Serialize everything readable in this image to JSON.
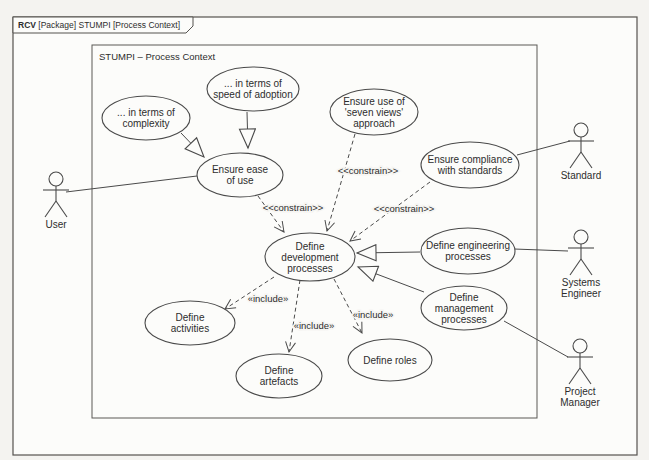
{
  "frame": {
    "keyword": "RCV",
    "title": " [Package] STUMPI [Process Context]"
  },
  "inner": {
    "title": "STUMPI – Process Context"
  },
  "colors": {
    "line": "#4a4a4a",
    "fill": "#fcfcfa",
    "background": "#f4f3f0",
    "text": "#2d2d2d"
  },
  "use_cases": [
    {
      "id": "in-terms-of-complexity",
      "cx": 146,
      "cy": 118,
      "rx": 44,
      "ry": 22,
      "lines": [
        "... in terms of",
        "complexity"
      ]
    },
    {
      "id": "in-terms-of-speed-of-adoption",
      "cx": 253,
      "cy": 89,
      "rx": 46,
      "ry": 22,
      "lines": [
        "... in terms of",
        "speed of adoption"
      ]
    },
    {
      "id": "ensure-ease-of-use",
      "cx": 240,
      "cy": 175,
      "rx": 43,
      "ry": 22,
      "lines": [
        "Ensure ease",
        "of use"
      ]
    },
    {
      "id": "ensure-use-of-seven-views",
      "cx": 374,
      "cy": 112,
      "rx": 44,
      "ry": 23,
      "lines": [
        "Ensure use of",
        "'seven views'",
        "approach"
      ]
    },
    {
      "id": "ensure-compliance-with-standards",
      "cx": 470,
      "cy": 165,
      "rx": 49,
      "ry": 23,
      "lines": [
        "Ensure compliance",
        "with standards"
      ]
    },
    {
      "id": "define-development-processes",
      "cx": 310,
      "cy": 257,
      "rx": 45,
      "ry": 24,
      "lines": [
        "Define",
        "development",
        "processes"
      ]
    },
    {
      "id": "define-engineering-processes",
      "cx": 468,
      "cy": 251,
      "rx": 47,
      "ry": 23,
      "lines": [
        "Define engineering",
        "processes"
      ]
    },
    {
      "id": "define-management-processes",
      "cx": 464,
      "cy": 308,
      "rx": 43,
      "ry": 22,
      "lines": [
        "Define",
        "management",
        "processes"
      ]
    },
    {
      "id": "define-activities",
      "cx": 190,
      "cy": 323,
      "rx": 45,
      "ry": 22,
      "lines": [
        "Define",
        "activities"
      ]
    },
    {
      "id": "define-artefacts",
      "cx": 279,
      "cy": 376,
      "rx": 43,
      "ry": 22,
      "lines": [
        "Define",
        "artefacts"
      ]
    },
    {
      "id": "define-roles",
      "cx": 390,
      "cy": 360,
      "rx": 42,
      "ry": 21,
      "lines": [
        "Define roles"
      ]
    }
  ],
  "actors": [
    {
      "id": "user",
      "cx": 56,
      "head_y": 179,
      "lines": [
        "User"
      ]
    },
    {
      "id": "standard",
      "cx": 581,
      "head_y": 130,
      "lines": [
        "Standard"
      ]
    },
    {
      "id": "systems-engineer",
      "cx": 581,
      "head_y": 237,
      "lines": [
        "Systems",
        "Engineer"
      ]
    },
    {
      "id": "project-manager",
      "cx": 580,
      "head_y": 346,
      "lines": [
        "Project",
        "Manager"
      ]
    }
  ],
  "edges": [
    {
      "id": "user--ensure-ease",
      "kind": "association",
      "dash": false,
      "end": "none",
      "x1": 66,
      "y1": 192,
      "x2": 197,
      "y2": 176
    },
    {
      "id": "compliance--standard",
      "kind": "association",
      "dash": false,
      "end": "none",
      "x1": 517,
      "y1": 155,
      "x2": 570,
      "y2": 141
    },
    {
      "id": "engineering--systems-engineer",
      "kind": "association",
      "dash": false,
      "end": "none",
      "x1": 514,
      "y1": 249,
      "x2": 568,
      "y2": 251
    },
    {
      "id": "management--project-manager",
      "kind": "association",
      "dash": false,
      "end": "none",
      "x1": 504,
      "y1": 321,
      "x2": 568,
      "y2": 357
    },
    {
      "id": "complexity--ensure-ease",
      "kind": "generalization",
      "dash": false,
      "end": "triangle",
      "x1": 181,
      "y1": 133,
      "x2": 204,
      "y2": 157
    },
    {
      "id": "speed--ensure-ease",
      "kind": "generalization",
      "dash": false,
      "end": "triangle",
      "x1": 247,
      "y1": 112,
      "x2": 248,
      "y2": 148
    },
    {
      "id": "engineering--development",
      "kind": "generalization",
      "dash": false,
      "end": "triangle",
      "x1": 420,
      "y1": 252,
      "x2": 357,
      "y2": 253
    },
    {
      "id": "management--development",
      "kind": "generalization",
      "dash": false,
      "end": "triangle",
      "x1": 424,
      "y1": 292,
      "x2": 358,
      "y2": 267
    },
    {
      "id": "ensure-ease--development-constrain",
      "kind": "constrain",
      "dash": true,
      "end": "open",
      "x1": 258,
      "y1": 196,
      "x2": 284,
      "y2": 232
    },
    {
      "id": "seven-views--development-constrain",
      "kind": "constrain",
      "dash": true,
      "end": "open",
      "x1": 355,
      "y1": 134,
      "x2": 327,
      "y2": 231
    },
    {
      "id": "compliance--development-constrain",
      "kind": "constrain",
      "dash": true,
      "end": "open",
      "x1": 430,
      "y1": 182,
      "x2": 350,
      "y2": 241
    },
    {
      "id": "development--activities-include",
      "kind": "include",
      "dash": true,
      "end": "open",
      "x1": 274,
      "y1": 277,
      "x2": 225,
      "y2": 309
    },
    {
      "id": "development--artefacts-include",
      "kind": "include",
      "dash": true,
      "end": "open",
      "x1": 300,
      "y1": 280,
      "x2": 289,
      "y2": 352
    },
    {
      "id": "development--roles-include",
      "kind": "include",
      "dash": true,
      "end": "open",
      "x1": 334,
      "y1": 279,
      "x2": 362,
      "y2": 333
    }
  ],
  "edge_labels": [
    {
      "id": "constrain-ease",
      "text": "<<constrain>>",
      "x": 293,
      "y": 211
    },
    {
      "id": "constrain-seven-views",
      "text": "<<constrain>>",
      "x": 368,
      "y": 174
    },
    {
      "id": "constrain-compliance",
      "text": "<<constrain>>",
      "x": 404,
      "y": 212
    },
    {
      "id": "include-activities",
      "text": "«include»",
      "x": 268,
      "y": 302
    },
    {
      "id": "include-artefacts",
      "text": "«include»",
      "x": 314,
      "y": 329
    },
    {
      "id": "include-roles",
      "text": "«include»",
      "x": 373,
      "y": 318
    }
  ]
}
